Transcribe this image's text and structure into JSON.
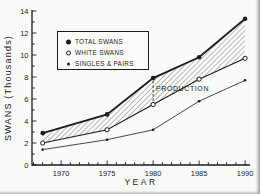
{
  "figure": {
    "paper_color": "#fafaf8",
    "ink_color": "#1b1b1b"
  },
  "chart_data": {
    "type": "line",
    "title": "",
    "xlabel": "YEAR",
    "ylabel": "SWANS (Thousands)",
    "units": "thousands of swans",
    "x": [
      1968,
      1975,
      1980,
      1985,
      1990
    ],
    "series": [
      {
        "name": "TOTAL SWANS",
        "marker": "filled-circle",
        "values": [
          2.9,
          4.6,
          7.9,
          9.8,
          13.3
        ]
      },
      {
        "name": "WHITE SWANS",
        "marker": "open-circle",
        "values": [
          2.0,
          3.2,
          5.5,
          7.8,
          9.7
        ]
      },
      {
        "name": "SINGLES & PAIRS",
        "marker": "small-dot",
        "values": [
          1.4,
          2.3,
          3.2,
          5.8,
          7.7
        ]
      }
    ],
    "xlim": [
      1966.9,
      1990.6
    ],
    "ylim": [
      0,
      14
    ],
    "x_major_ticks": [
      1970,
      1975,
      1980,
      1985,
      1990
    ],
    "x_minor_tick_step_years": 1,
    "y_major_ticks": [
      0,
      2,
      4,
      6,
      8,
      10,
      12,
      14
    ],
    "y_minor_tick_step": 1,
    "grid": "off",
    "legend_position": "upper-left-inside",
    "band": {
      "between": [
        "TOTAL SWANS",
        "WHITE SWANS"
      ],
      "style": "diagonal-hatch",
      "meaning": "PRODUCTION"
    },
    "annotation": {
      "label": "PRODUCTION",
      "x": 1980,
      "y_from": 7.9,
      "y_to": 5.5,
      "style": "dashed-vertical-line"
    }
  }
}
